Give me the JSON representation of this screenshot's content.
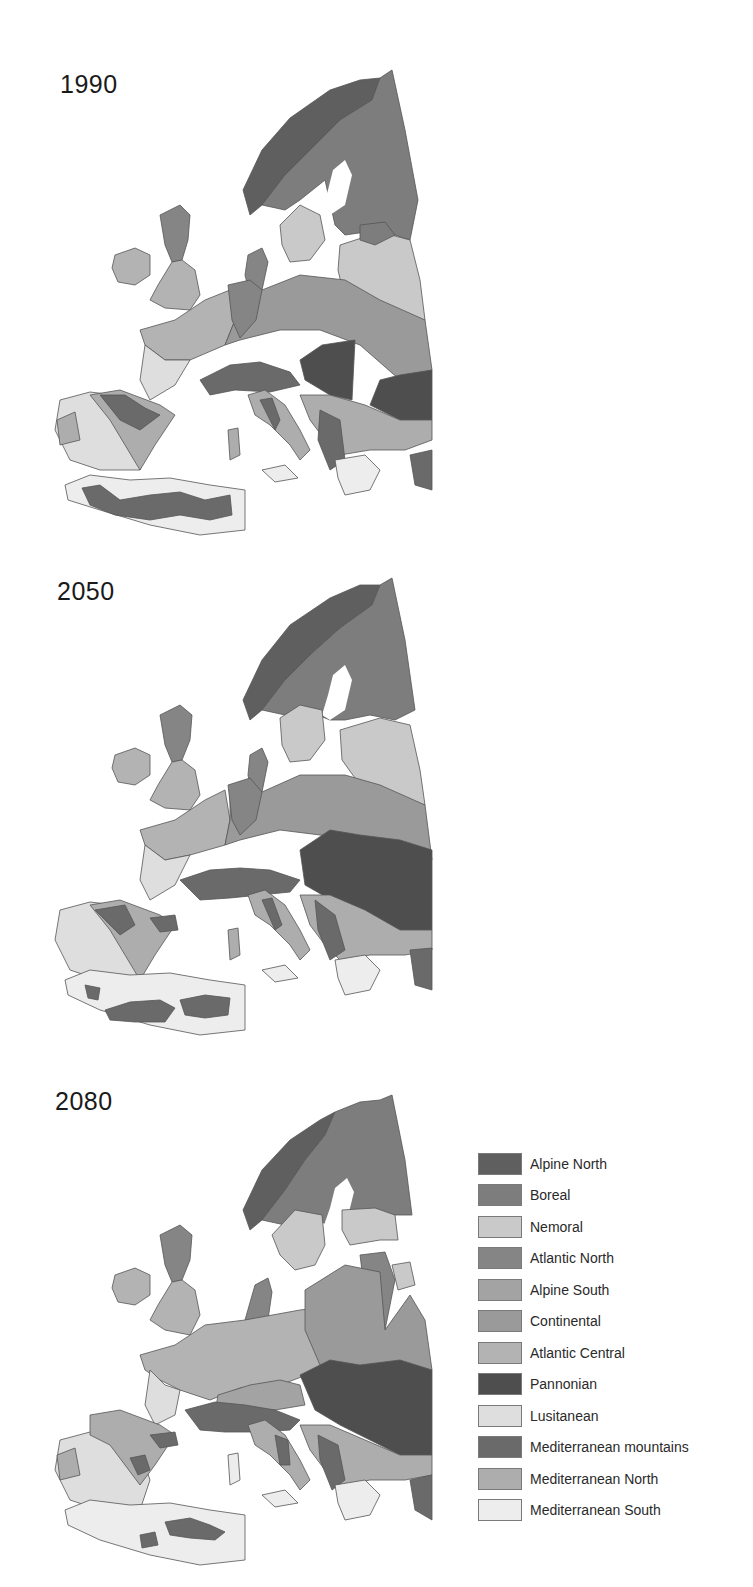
{
  "figure": {
    "panels": [
      {
        "year": "1990"
      },
      {
        "year": "2050"
      },
      {
        "year": "2080"
      }
    ]
  },
  "legend": {
    "items": [
      {
        "label": "Alpine North",
        "color": "#5f5f5f"
      },
      {
        "label": "Boreal",
        "color": "#7d7d7d"
      },
      {
        "label": "Nemoral",
        "color": "#c9c9c9"
      },
      {
        "label": "Atlantic North",
        "color": "#858585"
      },
      {
        "label": "Alpine South",
        "color": "#a3a3a3"
      },
      {
        "label": "Continental",
        "color": "#9a9a9a"
      },
      {
        "label": "Atlantic Central",
        "color": "#b3b3b3"
      },
      {
        "label": "Pannonian",
        "color": "#4e4e4e"
      },
      {
        "label": "Lusitanean",
        "color": "#dedede"
      },
      {
        "label": "Mediterranean mountains",
        "color": "#6a6a6a"
      },
      {
        "label": "Mediterranean North",
        "color": "#adadad"
      },
      {
        "label": "Mediterranean South",
        "color": "#ededed"
      }
    ]
  }
}
